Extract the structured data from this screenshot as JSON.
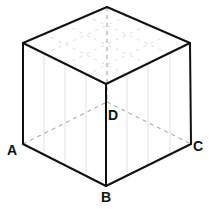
{
  "diagram": {
    "type": "isometric-cube",
    "labels": {
      "A": "A",
      "B": "B",
      "C": "C",
      "D": "D"
    },
    "colors": {
      "edge": "#111111",
      "hidden_edge": "#9a9a9a",
      "grid": "#d8d8d8",
      "background": "#ffffff"
    }
  }
}
